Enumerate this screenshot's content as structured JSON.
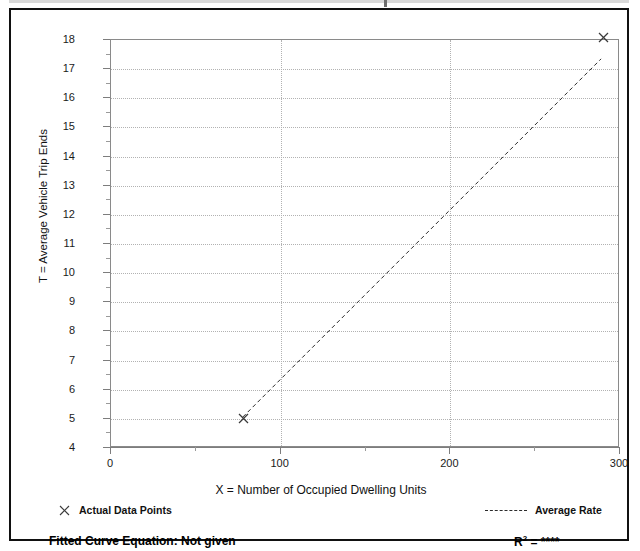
{
  "chart_data": {
    "type": "scatter",
    "title": "",
    "xlabel": "X = Number of Occupied Dwelling Units",
    "ylabel": "T = Average Vehicle Trip Ends",
    "xlim": [
      0,
      300
    ],
    "ylim": [
      4,
      18
    ],
    "x_ticks": [
      0,
      100,
      200,
      300
    ],
    "x_ticks_minor": [
      50,
      150,
      250
    ],
    "y_ticks": [
      4,
      5,
      6,
      7,
      8,
      9,
      10,
      11,
      12,
      13,
      14,
      15,
      16,
      17,
      18
    ],
    "grid": "dotted-both",
    "legend_position": "below-plot",
    "series": [
      {
        "name": "Actual Data Points",
        "marker": "x",
        "points": [
          {
            "x": 78,
            "y": 5.0
          },
          {
            "x": 290,
            "y": 18.1
          }
        ]
      },
      {
        "name": "Average Rate",
        "style": "dashed-line",
        "points": [
          {
            "x": 78,
            "y": 5.0
          },
          {
            "x": 290,
            "y": 17.35
          }
        ]
      }
    ]
  },
  "axes": {
    "y_title": "T = Average Vehicle Trip Ends",
    "x_title": "X = Number of Occupied Dwelling Units",
    "y_tick_labels": [
      "18",
      "17",
      "16",
      "15",
      "14",
      "13",
      "12",
      "11",
      "10",
      "9",
      "8",
      "7",
      "6",
      "5",
      "4"
    ],
    "x_tick_labels": [
      "0",
      "100",
      "200",
      "300"
    ]
  },
  "legend": {
    "data_points_label": "Actual Data Points",
    "average_rate_label": "Average Rate",
    "marker_icon": "x-cross-icon",
    "line_icon": "dashed-line-icon"
  },
  "footer": {
    "fitted_curve_label": "Fitted Curve Equation:  Not given",
    "r_squared_prefix": "R",
    "r_squared_exponent": "2",
    "r_squared_value": " = ****"
  },
  "colors": {
    "frame": "#111111",
    "grid": "#b2b2b2",
    "axis": "#7d7d7d",
    "marker": "#3a3a3a",
    "trend": "#2b2b2b"
  }
}
